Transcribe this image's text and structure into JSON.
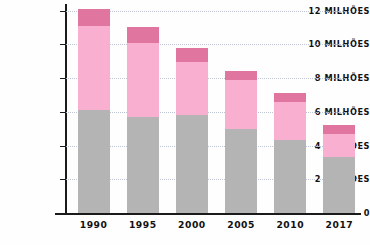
{
  "chart_data": {
    "type": "bar",
    "stacked": true,
    "title": "",
    "subtitle": "",
    "xlabel": "",
    "ylabel": "",
    "categories": [
      "1990",
      "1995",
      "2000",
      "2005",
      "2010",
      "2017"
    ],
    "series": [
      {
        "name": "base",
        "color": "#b4b4b4",
        "values": [
          6.1,
          5.7,
          5.8,
          5.0,
          4.3,
          3.3
        ]
      },
      {
        "name": "middle",
        "color": "#f9afd0",
        "values": [
          5.0,
          4.4,
          3.15,
          2.9,
          2.3,
          1.4
        ]
      },
      {
        "name": "top",
        "color": "#e0759f",
        "values": [
          1.0,
          0.9,
          0.85,
          0.5,
          0.5,
          0.5
        ]
      }
    ],
    "totals": [
      12.1,
      11.0,
      9.8,
      8.4,
      7.1,
      5.2
    ],
    "ylim": [
      0,
      12
    ],
    "ytick_values": [
      12,
      10,
      8,
      6,
      4,
      2,
      0
    ],
    "ytick_labels": [
      "12 MILHÕES",
      "10 MILHÕES",
      "8 MILHÕES",
      "6 MILHÕES",
      "4 MILHÕES",
      "2 MILHÕES",
      "0"
    ],
    "grid": true,
    "gridline_color": "#b9c3cf",
    "legend": [],
    "legend_position": "none",
    "axis_color": "#1a1a1a",
    "background": "#ffffff"
  }
}
